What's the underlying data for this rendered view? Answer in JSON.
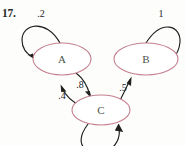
{
  "problem": {
    "number": "17."
  },
  "diagram": {
    "type": "state-transition-diagram",
    "node_outline_color": "#c4808f",
    "edge_color": "#1f1f1d",
    "label_color": "#23231f",
    "background_color": "#fdfdfc",
    "nodes": [
      {
        "id": "A",
        "label": "A",
        "cx": 62,
        "cy": 59,
        "rx": 29,
        "ry": 16
      },
      {
        "id": "B",
        "label": "B",
        "cx": 146,
        "cy": 59,
        "rx": 32,
        "ry": 16
      },
      {
        "id": "C",
        "label": "C",
        "cx": 101,
        "cy": 110,
        "rx": 29,
        "ry": 15
      }
    ],
    "edges": [
      {
        "from": "A",
        "to": "A",
        "label": ".2",
        "kind": "self-loop",
        "label_x": 41,
        "label_y": 17
      },
      {
        "from": "B",
        "to": "B",
        "label": "1",
        "kind": "self-loop",
        "label_x": 161,
        "label_y": 17
      },
      {
        "from": "C",
        "to": "C",
        "label": "",
        "kind": "self-loop",
        "label_x": 0,
        "label_y": 0
      },
      {
        "from": "A",
        "to": "C",
        "label": ".8",
        "kind": "curve",
        "label_x": 80,
        "label_y": 88
      },
      {
        "from": "C",
        "to": "A",
        "label": ".4",
        "kind": "curve",
        "label_x": 62,
        "label_y": 99
      },
      {
        "from": "C",
        "to": "B",
        "label": ".5",
        "kind": "curve",
        "label_x": 123,
        "label_y": 91
      }
    ]
  }
}
